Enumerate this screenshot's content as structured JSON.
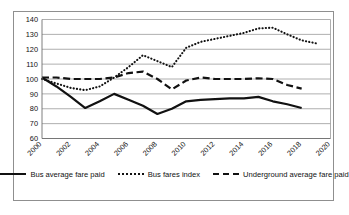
{
  "chart_data": {
    "type": "line",
    "title": "",
    "xlabel": "",
    "ylabel": "",
    "ylim": [
      60,
      140
    ],
    "ytick_step": 10,
    "yticks": [
      60,
      70,
      80,
      90,
      100,
      110,
      120,
      130,
      140
    ],
    "xlim": [
      2000,
      2020
    ],
    "xtick_step": 2,
    "xticks": [
      2000,
      2002,
      2004,
      2006,
      2008,
      2010,
      2012,
      2014,
      2016,
      2018,
      2020
    ],
    "xtick_rotation": "45",
    "grid": "horizontal",
    "legend_position": "bottom",
    "x": [
      2000,
      2001,
      2002,
      2003,
      2004,
      2005,
      2006,
      2007,
      2008,
      2009,
      2010,
      2011,
      2012,
      2013,
      2014,
      2015,
      2016,
      2017,
      2018,
      2019
    ],
    "series": [
      {
        "name": "Bus average fare paid",
        "style": "solid",
        "color": "#111111",
        "values": [
          101,
          95,
          88,
          80.5,
          85,
          90,
          86,
          82,
          76.5,
          80,
          85,
          86,
          86.5,
          87,
          87,
          88,
          85,
          83,
          80.5,
          null
        ]
      },
      {
        "name": "Bus fares index",
        "style": "dotted",
        "color": "#111111",
        "values": [
          100,
          97,
          94,
          92.5,
          95,
          101,
          108,
          116,
          112,
          108,
          121,
          125,
          127,
          129,
          131,
          134,
          134.5,
          130,
          126,
          124
        ]
      },
      {
        "name": "Underground average fare paid",
        "style": "dashed",
        "color": "#111111",
        "values": [
          101,
          101,
          100,
          100,
          100,
          101,
          104,
          105,
          100,
          93,
          99,
          101,
          100,
          100,
          100,
          100.5,
          100,
          96,
          93.5,
          null
        ]
      }
    ]
  },
  "legend": {
    "items": [
      {
        "label": "Bus average fare paid",
        "style": "solid"
      },
      {
        "label": "Bus fares index",
        "style": "dotted"
      },
      {
        "label": "Underground average fare paid",
        "style": "dashed"
      }
    ]
  }
}
